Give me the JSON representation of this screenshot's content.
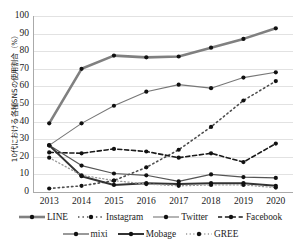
{
  "axis": {
    "y_title": "10代における各種SNSの使用割合（%）",
    "y_ticks": [
      "100",
      "90",
      "80",
      "70",
      "60",
      "50",
      "40",
      "30",
      "20",
      "10",
      "0"
    ],
    "x_ticks": [
      "2013",
      "2014",
      "2015",
      "2016",
      "2017",
      "2018",
      "2019",
      "2020"
    ]
  },
  "legend": {
    "row1": [
      {
        "label": "LINE",
        "key": "line-solid-thick-gray"
      },
      {
        "label": "Instagram",
        "key": "line-dotted-gray"
      },
      {
        "label": "Twitter",
        "key": "line-solid-thin-gray"
      },
      {
        "label": "Facebook",
        "key": "line-dashed-black"
      }
    ],
    "row2": [
      {
        "label": "mixi",
        "key": "line-solid-thin-dark"
      },
      {
        "label": "Mobage",
        "key": "line-solid-thick-dark"
      },
      {
        "label": "GREE",
        "key": "line-dotted-light"
      }
    ]
  },
  "chart_data": {
    "type": "line",
    "title": "",
    "xlabel": "",
    "ylabel": "10代における各種SNSの使用割合（%）",
    "ylim": [
      0,
      100
    ],
    "ytick_step": 10,
    "grid": true,
    "legend_position": "bottom",
    "categories": [
      "2013",
      "2014",
      "2015",
      "2016",
      "2017",
      "2018",
      "2019",
      "2020"
    ],
    "series": [
      {
        "name": "LINE",
        "values": [
          39,
          70,
          77.5,
          76.5,
          77,
          82,
          87,
          93
        ],
        "color": "#808080",
        "style": "solid",
        "width": 2.6
      },
      {
        "name": "Instagram",
        "values": [
          2,
          3.5,
          6.5,
          14,
          24,
          37,
          52,
          63
        ],
        "color": "#4d4d4d",
        "style": "dotted",
        "width": 1.6
      },
      {
        "name": "Twitter",
        "values": [
          26.5,
          39,
          49,
          57,
          61,
          59,
          65,
          68
        ],
        "color": "#777777",
        "style": "solid",
        "width": 1.1
      },
      {
        "name": "Facebook",
        "values": [
          22.5,
          22,
          24.5,
          23,
          19.5,
          22,
          17,
          27.5
        ],
        "color": "#1a1a1a",
        "style": "dashed",
        "width": 1.6
      },
      {
        "name": "mixi",
        "values": [
          26.5,
          15,
          10.5,
          9.5,
          6,
          10,
          8.5,
          8
        ],
        "color": "#555555",
        "style": "solid",
        "width": 1.2
      },
      {
        "name": "Mobage",
        "values": [
          26.5,
          9,
          4,
          5,
          4.5,
          5,
          5,
          3.5
        ],
        "color": "#333333",
        "style": "solid",
        "width": 2.0
      },
      {
        "name": "GREE",
        "values": [
          19.5,
          9.5,
          6.5,
          4.5,
          3.5,
          4,
          4,
          2.5
        ],
        "color": "#999999",
        "style": "dotted",
        "width": 1.3
      }
    ]
  }
}
